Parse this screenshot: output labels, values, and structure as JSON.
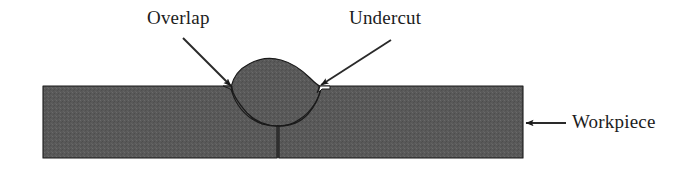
{
  "figure": {
    "background_color": "#ffffff"
  },
  "labels": {
    "overlap": "Overlap",
    "undercut": "Undercut",
    "workpiece": "Workpiece"
  },
  "colors": {
    "metal_fill": "#595959",
    "metal_fill_dark": "#4e4e4e",
    "outline": "#1a1a1a",
    "text": "#1c1c1c",
    "background": "#ffffff",
    "leader": "#2a2a2a"
  },
  "geometry": {
    "plate": {
      "left": 43,
      "right": 523,
      "top": 86,
      "bottom": 158
    },
    "bead": {
      "left_toe_x": 228,
      "right_toe_x": 322,
      "crown_y": 60,
      "surface_y": 86
    },
    "fusion_zone": {
      "root_x": 278,
      "root_y": 126
    },
    "joint_line": {
      "x": 278,
      "top_y": 126,
      "bottom_y": 158
    }
  },
  "annotations": [
    {
      "name": "overlap",
      "label": "Overlap",
      "label_x": 147,
      "label_y": 8,
      "arrow_from": [
        183,
        38
      ],
      "arrow_to": [
        231,
        86
      ],
      "description": "Weld metal lapping over the plate surface at the left toe without fusion"
    },
    {
      "name": "undercut",
      "label": "Undercut",
      "label_x": 349,
      "label_y": 8,
      "arrow_from": [
        391,
        40
      ],
      "arrow_to": [
        320,
        84
      ],
      "description": "Groove melted into the base metal at the right toe, left unfilled"
    },
    {
      "name": "workpiece",
      "label": "Workpiece",
      "label_x": 572,
      "label_y": 112,
      "arrow_from": [
        566,
        123
      ],
      "arrow_to": [
        525,
        123
      ],
      "description": "Base metal plate being welded"
    }
  ]
}
